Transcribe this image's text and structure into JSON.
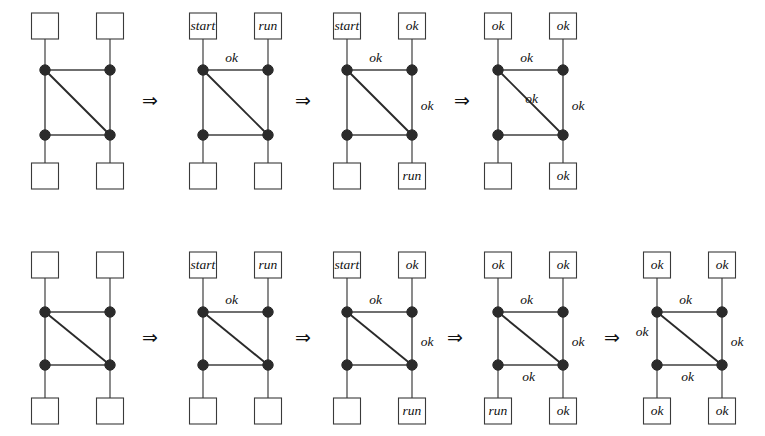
{
  "figure": {
    "background": "#ffffff",
    "ink": "#2b2b2b",
    "arrow_glyph": "⇒",
    "empty_label": "",
    "geometry": {
      "box_w": 27,
      "box_h": 26,
      "node_r": 5.2,
      "row1": {
        "box_top_y": 13,
        "node_top_y": 70,
        "node_bot_y": 135,
        "box_bot_y": 163
      },
      "row2": {
        "box_top_y": 252,
        "node_top_y": 312,
        "node_bot_y": 365,
        "box_bot_y": 398
      }
    }
  },
  "rows": [
    {
      "id": "row-1",
      "name": "sequence-row-top",
      "panels": [
        {
          "id": "r1p1",
          "name": "panel-1",
          "left_x": 45,
          "right_x": 110,
          "boxes": {
            "top_left": "",
            "top_right": "",
            "bottom_left": "",
            "bottom_right": ""
          },
          "edges": {
            "top": "",
            "left": "",
            "right": "",
            "bottom": "",
            "diagonal": ""
          }
        },
        {
          "id": "r1p2",
          "name": "panel-2",
          "left_x": 203,
          "right_x": 268,
          "boxes": {
            "top_left": "start",
            "top_right": "run",
            "bottom_left": "",
            "bottom_right": ""
          },
          "edges": {
            "top": "ok",
            "left": "",
            "right": "",
            "bottom": "",
            "diagonal": ""
          }
        },
        {
          "id": "r1p3",
          "name": "panel-3",
          "left_x": 347,
          "right_x": 412,
          "boxes": {
            "top_left": "start",
            "top_right": "ok",
            "bottom_left": "",
            "bottom_right": "run"
          },
          "edges": {
            "top": "ok",
            "left": "",
            "right": "ok",
            "bottom": "",
            "diagonal": ""
          }
        },
        {
          "id": "r1p4",
          "name": "panel-4",
          "left_x": 498,
          "right_x": 563,
          "boxes": {
            "top_left": "ok",
            "top_right": "ok",
            "bottom_left": "",
            "bottom_right": "ok"
          },
          "edges": {
            "top": "ok",
            "left": "",
            "right": "ok",
            "bottom": "",
            "diagonal": "ok"
          }
        }
      ],
      "arrows": [
        {
          "name": "rewrite-arrow-1",
          "x": 150,
          "y": 101
        },
        {
          "name": "rewrite-arrow-2",
          "x": 303,
          "y": 101
        },
        {
          "name": "rewrite-arrow-3",
          "x": 462,
          "y": 101
        }
      ]
    },
    {
      "id": "row-2",
      "name": "sequence-row-bottom",
      "panels": [
        {
          "id": "r2p1",
          "name": "panel-1",
          "left_x": 45,
          "right_x": 110,
          "boxes": {
            "top_left": "",
            "top_right": "",
            "bottom_left": "",
            "bottom_right": ""
          },
          "edges": {
            "top": "",
            "left": "",
            "right": "",
            "bottom": "",
            "diagonal": ""
          }
        },
        {
          "id": "r2p2",
          "name": "panel-2",
          "left_x": 203,
          "right_x": 268,
          "boxes": {
            "top_left": "start",
            "top_right": "run",
            "bottom_left": "",
            "bottom_right": ""
          },
          "edges": {
            "top": "ok",
            "left": "",
            "right": "",
            "bottom": "",
            "diagonal": ""
          }
        },
        {
          "id": "r2p3",
          "name": "panel-3",
          "left_x": 347,
          "right_x": 412,
          "boxes": {
            "top_left": "start",
            "top_right": "ok",
            "bottom_left": "",
            "bottom_right": "run"
          },
          "edges": {
            "top": "ok",
            "left": "",
            "right": "ok",
            "bottom": "",
            "diagonal": ""
          }
        },
        {
          "id": "r2p4",
          "name": "panel-4",
          "left_x": 498,
          "right_x": 563,
          "boxes": {
            "top_left": "ok",
            "top_right": "ok",
            "bottom_left": "run",
            "bottom_right": "ok"
          },
          "edges": {
            "top": "ok",
            "left": "",
            "right": "ok",
            "bottom": "ok",
            "diagonal": ""
          }
        },
        {
          "id": "r2p5",
          "name": "panel-5",
          "left_x": 657,
          "right_x": 722,
          "boxes": {
            "top_left": "ok",
            "top_right": "ok",
            "bottom_left": "ok",
            "bottom_right": "ok"
          },
          "edges": {
            "top": "ok",
            "left": "ok",
            "right": "ok",
            "bottom": "ok",
            "diagonal": ""
          }
        }
      ],
      "arrows": [
        {
          "name": "rewrite-arrow-1",
          "x": 150,
          "y": 338
        },
        {
          "name": "rewrite-arrow-2",
          "x": 303,
          "y": 338
        },
        {
          "name": "rewrite-arrow-3",
          "x": 455,
          "y": 338
        },
        {
          "name": "rewrite-arrow-4",
          "x": 612,
          "y": 338
        }
      ]
    }
  ]
}
